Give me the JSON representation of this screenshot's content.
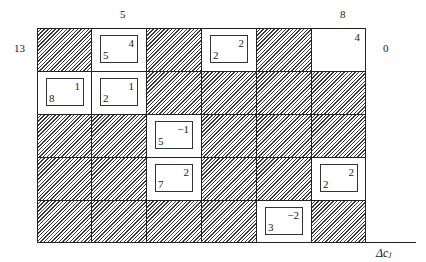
{
  "diagram": {
    "title": "",
    "top_labels": [
      {
        "col": 1,
        "text": "5"
      },
      {
        "col": 5,
        "text": "8"
      }
    ],
    "left_labels": [
      {
        "row": 0,
        "text": "13"
      }
    ],
    "right_labels": [
      {
        "row": 0,
        "text": "0"
      }
    ],
    "axis_label": "Δc_j",
    "axis_label_display": "Δcⱼ",
    "rows": 5,
    "cols": 6,
    "cells": [
      [
        {
          "hatched": true
        },
        {
          "hatched": false,
          "box": true,
          "top_right": "4",
          "bottom_left": "5"
        },
        {
          "hatched": true
        },
        {
          "hatched": false,
          "box": true,
          "top_right": "2",
          "bottom_left": "2"
        },
        {
          "hatched": true
        },
        {
          "hatched": false,
          "box": false,
          "top_right": "4"
        }
      ],
      [
        {
          "hatched": false,
          "box": true,
          "top_right": "1",
          "bottom_left": "8"
        },
        {
          "hatched": false,
          "box": true,
          "top_right": "1",
          "bottom_left": "2"
        },
        {
          "hatched": true
        },
        {
          "hatched": true
        },
        {
          "hatched": true
        },
        {
          "hatched": true
        }
      ],
      [
        {
          "hatched": true
        },
        {
          "hatched": true
        },
        {
          "hatched": false,
          "box": true,
          "top_right": "−1",
          "bottom_left": "5"
        },
        {
          "hatched": true
        },
        {
          "hatched": true
        },
        {
          "hatched": true
        }
      ],
      [
        {
          "hatched": true
        },
        {
          "hatched": true
        },
        {
          "hatched": false,
          "box": true,
          "top_right": "2",
          "bottom_left": "7"
        },
        {
          "hatched": true
        },
        {
          "hatched": true
        },
        {
          "hatched": false,
          "box": true,
          "top_right": "2",
          "bottom_left": "2"
        }
      ],
      [
        {
          "hatched": true
        },
        {
          "hatched": true
        },
        {
          "hatched": true
        },
        {
          "hatched": true
        },
        {
          "hatched": false,
          "box": true,
          "top_right": "−2",
          "bottom_left": "3"
        },
        {
          "hatched": true
        }
      ]
    ]
  }
}
